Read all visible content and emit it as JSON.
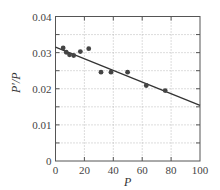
{
  "chart_data": {
    "type": "scatter",
    "title": "",
    "xlabel": "P",
    "ylabel": "P′/P",
    "xlim": [
      0,
      100
    ],
    "ylim": [
      0,
      0.04
    ],
    "xticks": [
      "0",
      "20",
      "40",
      "60",
      "80",
      "100"
    ],
    "yticks": [
      "0",
      "0.01",
      "0.02",
      "0.03",
      "0.04"
    ],
    "grid": true,
    "series": [
      {
        "name": "data",
        "kind": "scatter",
        "x": [
          5.3,
          7.4,
          9.7,
          12.6,
          17.2,
          23.0,
          31.5,
          38.4,
          49.9,
          62.8,
          75.9
        ],
        "y": [
          0.0313,
          0.0301,
          0.0294,
          0.0292,
          0.0303,
          0.0311,
          0.0246,
          0.0246,
          0.0246,
          0.0209,
          0.0195
        ]
      },
      {
        "name": "fit line",
        "kind": "line",
        "x": [
          0,
          100
        ],
        "y": [
          0.0315,
          0.0154
        ]
      }
    ],
    "colors": {
      "points": "#444444",
      "line": "#333333",
      "axes": "#555555",
      "grid": "#aaaaaa"
    }
  }
}
